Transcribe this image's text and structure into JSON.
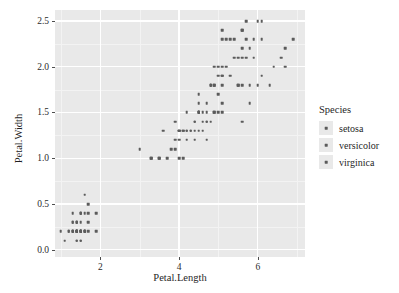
{
  "chart_data": {
    "type": "scatter",
    "title": "",
    "xlabel": "Petal.Length",
    "ylabel": "Petal.Width",
    "xlim": [
      0.85,
      7.2
    ],
    "ylim": [
      -0.08,
      2.62
    ],
    "xticks": [
      "2",
      "4",
      "6"
    ],
    "xtick_values": [
      2,
      4,
      6
    ],
    "yticks": [
      "0.0",
      "0.5",
      "1.0",
      "1.5",
      "2.0",
      "2.5"
    ],
    "ytick_values": [
      0.0,
      0.5,
      1.0,
      1.5,
      2.0,
      2.5
    ],
    "grid": true,
    "legend_position": "right",
    "legend_title": "Species",
    "point_color": "#5b5b5b",
    "panel_color": "#e9e9e9",
    "gridline_color": "#ffffff",
    "series": [
      {
        "name": "setosa",
        "points": [
          [
            1.4,
            0.2
          ],
          [
            1.4,
            0.2
          ],
          [
            1.3,
            0.2
          ],
          [
            1.5,
            0.2
          ],
          [
            1.4,
            0.2
          ],
          [
            1.7,
            0.4
          ],
          [
            1.4,
            0.3
          ],
          [
            1.5,
            0.2
          ],
          [
            1.4,
            0.2
          ],
          [
            1.5,
            0.1
          ],
          [
            1.5,
            0.2
          ],
          [
            1.6,
            0.2
          ],
          [
            1.4,
            0.1
          ],
          [
            1.1,
            0.1
          ],
          [
            1.2,
            0.2
          ],
          [
            1.5,
            0.4
          ],
          [
            1.3,
            0.4
          ],
          [
            1.4,
            0.3
          ],
          [
            1.7,
            0.3
          ],
          [
            1.5,
            0.3
          ],
          [
            1.7,
            0.2
          ],
          [
            1.5,
            0.4
          ],
          [
            1.0,
            0.2
          ],
          [
            1.7,
            0.5
          ],
          [
            1.9,
            0.2
          ],
          [
            1.6,
            0.2
          ],
          [
            1.6,
            0.4
          ],
          [
            1.5,
            0.2
          ],
          [
            1.4,
            0.2
          ],
          [
            1.6,
            0.2
          ],
          [
            1.6,
            0.2
          ],
          [
            1.5,
            0.4
          ],
          [
            1.5,
            0.1
          ],
          [
            1.4,
            0.2
          ],
          [
            1.5,
            0.2
          ],
          [
            1.2,
            0.2
          ],
          [
            1.3,
            0.2
          ],
          [
            1.4,
            0.1
          ],
          [
            1.3,
            0.2
          ],
          [
            1.5,
            0.2
          ],
          [
            1.3,
            0.3
          ],
          [
            1.3,
            0.3
          ],
          [
            1.3,
            0.2
          ],
          [
            1.6,
            0.6
          ],
          [
            1.9,
            0.4
          ],
          [
            1.4,
            0.3
          ],
          [
            1.6,
            0.2
          ],
          [
            1.4,
            0.2
          ],
          [
            1.5,
            0.2
          ],
          [
            1.4,
            0.2
          ]
        ]
      },
      {
        "name": "versicolor",
        "points": [
          [
            4.7,
            1.4
          ],
          [
            4.5,
            1.5
          ],
          [
            4.9,
            1.5
          ],
          [
            4.0,
            1.3
          ],
          [
            4.6,
            1.5
          ],
          [
            4.5,
            1.3
          ],
          [
            4.7,
            1.6
          ],
          [
            3.3,
            1.0
          ],
          [
            4.6,
            1.3
          ],
          [
            3.9,
            1.4
          ],
          [
            3.5,
            1.0
          ],
          [
            4.2,
            1.5
          ],
          [
            4.0,
            1.0
          ],
          [
            4.7,
            1.4
          ],
          [
            3.6,
            1.3
          ],
          [
            4.4,
            1.4
          ],
          [
            4.5,
            1.5
          ],
          [
            4.1,
            1.0
          ],
          [
            4.5,
            1.5
          ],
          [
            3.9,
            1.1
          ],
          [
            4.8,
            1.8
          ],
          [
            4.0,
            1.3
          ],
          [
            4.9,
            1.5
          ],
          [
            4.7,
            1.2
          ],
          [
            4.3,
            1.3
          ],
          [
            4.4,
            1.4
          ],
          [
            4.8,
            1.4
          ],
          [
            5.0,
            1.7
          ],
          [
            4.5,
            1.5
          ],
          [
            3.5,
            1.0
          ],
          [
            3.8,
            1.1
          ],
          [
            3.7,
            1.0
          ],
          [
            3.9,
            1.2
          ],
          [
            5.1,
            1.6
          ],
          [
            4.5,
            1.5
          ],
          [
            4.5,
            1.6
          ],
          [
            4.7,
            1.5
          ],
          [
            4.4,
            1.3
          ],
          [
            4.1,
            1.3
          ],
          [
            4.0,
            1.3
          ],
          [
            4.4,
            1.2
          ],
          [
            4.6,
            1.4
          ],
          [
            4.0,
            1.2
          ],
          [
            3.3,
            1.0
          ],
          [
            4.2,
            1.3
          ],
          [
            4.2,
            1.2
          ],
          [
            4.2,
            1.3
          ],
          [
            4.3,
            1.3
          ],
          [
            3.0,
            1.1
          ],
          [
            4.1,
            1.3
          ]
        ]
      },
      {
        "name": "virginica",
        "points": [
          [
            6.0,
            2.5
          ],
          [
            5.1,
            1.9
          ],
          [
            5.9,
            2.1
          ],
          [
            5.6,
            1.8
          ],
          [
            5.8,
            2.2
          ],
          [
            6.6,
            2.1
          ],
          [
            4.5,
            1.7
          ],
          [
            6.3,
            1.8
          ],
          [
            5.8,
            1.8
          ],
          [
            6.1,
            2.5
          ],
          [
            5.1,
            2.0
          ],
          [
            5.3,
            1.9
          ],
          [
            5.5,
            2.1
          ],
          [
            5.0,
            2.0
          ],
          [
            5.1,
            2.4
          ],
          [
            5.3,
            2.3
          ],
          [
            5.5,
            1.8
          ],
          [
            6.7,
            2.2
          ],
          [
            6.9,
            2.3
          ],
          [
            5.0,
            1.5
          ],
          [
            5.7,
            2.3
          ],
          [
            4.9,
            2.0
          ],
          [
            6.7,
            2.0
          ],
          [
            4.9,
            1.8
          ],
          [
            5.7,
            2.1
          ],
          [
            6.0,
            1.8
          ],
          [
            4.8,
            1.8
          ],
          [
            4.9,
            1.8
          ],
          [
            5.6,
            2.1
          ],
          [
            5.8,
            1.6
          ],
          [
            6.1,
            1.9
          ],
          [
            6.4,
            2.0
          ],
          [
            5.6,
            2.2
          ],
          [
            5.1,
            1.5
          ],
          [
            5.6,
            1.4
          ],
          [
            6.1,
            2.3
          ],
          [
            5.6,
            2.4
          ],
          [
            5.5,
            1.8
          ],
          [
            4.8,
            1.8
          ],
          [
            5.4,
            2.1
          ],
          [
            5.6,
            2.4
          ],
          [
            5.1,
            2.3
          ],
          [
            5.1,
            1.9
          ],
          [
            5.9,
            2.3
          ],
          [
            5.7,
            2.5
          ],
          [
            5.2,
            2.3
          ],
          [
            5.0,
            1.9
          ],
          [
            5.2,
            2.0
          ],
          [
            5.4,
            2.3
          ],
          [
            5.1,
            1.8
          ]
        ]
      }
    ]
  },
  "axes": {
    "x_title": "Petal.Length",
    "y_title": "Petal.Width"
  },
  "legend": {
    "title": "Species",
    "items": [
      {
        "label": "setosa"
      },
      {
        "label": "versicolor"
      },
      {
        "label": "virginica"
      }
    ]
  }
}
